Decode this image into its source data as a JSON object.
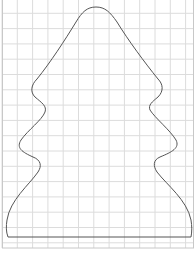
{
  "diagram": {
    "grid": {
      "spacing": 15.3,
      "origin_x": 2,
      "origin_y": -2,
      "line_color": "#dcdcdc",
      "border_color": "#c8c8c8",
      "area": {
        "x": 2,
        "y": 0,
        "width": 192,
        "height": 248
      }
    },
    "outline": {
      "stroke": "#555555",
      "stroke_width": 1,
      "path": "M 8 237 L 191 237 C 192 232 192 226 191 220 C 187 200 167 185 157 172 C 153 166 153 160 160 157 C 172 152 180 148 176 140 C 170 130 155 118 150 110 C 148 105 152 102 158 97 C 164 91 163 84 158 79 C 145 63 128 40 117 22 C 110 12 105 7 96 7 C 87 7 82 12 76 22 C 65 40 50 63 37 79 C 31 85 30 92 35 97 C 42 103 47 106 45 112 C 42 120 28 130 21 140 C 16 148 22 152 33 157 C 41 160 42 166 38 172 C 29 185 10 200 7 220 C 6 226 6 232 8 237 Z"
    }
  }
}
